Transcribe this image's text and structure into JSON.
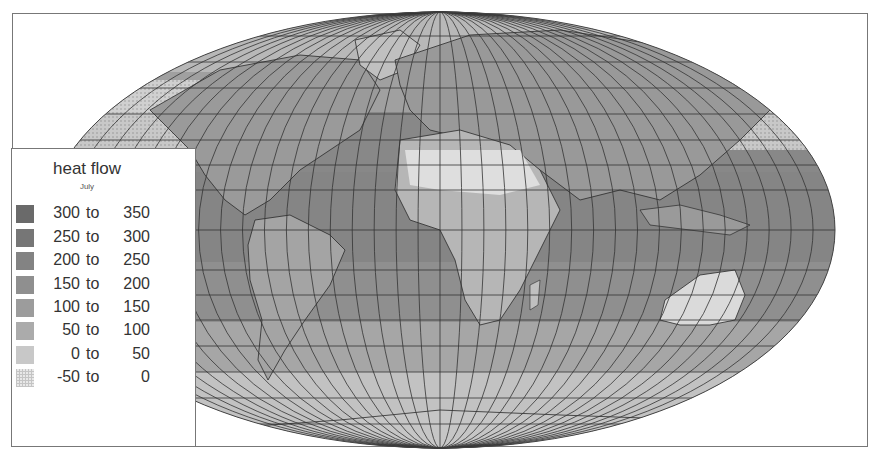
{
  "legend": {
    "title": "heat flow",
    "subtitle": "July",
    "classes": [
      {
        "lo": "300",
        "to": "to",
        "hi": "350",
        "color": "#6a6a6a",
        "pattern": "solid"
      },
      {
        "lo": "250",
        "to": "to",
        "hi": "300",
        "color": "#767676",
        "pattern": "solid"
      },
      {
        "lo": "200",
        "to": "to",
        "hi": "250",
        "color": "#838383",
        "pattern": "solid"
      },
      {
        "lo": "150",
        "to": "to",
        "hi": "200",
        "color": "#8f8f8f",
        "pattern": "solid"
      },
      {
        "lo": "100",
        "to": "to",
        "hi": "150",
        "color": "#9c9c9c",
        "pattern": "solid"
      },
      {
        "lo": "50",
        "to": "to",
        "hi": "100",
        "color": "#ababab",
        "pattern": "solid"
      },
      {
        "lo": "0",
        "to": "to",
        "hi": "50",
        "color": "#c8c8c8",
        "pattern": "solid"
      },
      {
        "lo": "-50",
        "to": "to",
        "hi": "0",
        "color": "#d6d6d6",
        "pattern": "dotted"
      }
    ]
  },
  "map": {
    "projection": "mollweide-like",
    "graticule_step_deg": 10,
    "ocean_color": "#8e8e8e",
    "land_light_color": "#d2d2d2",
    "graticule_color": "#333333",
    "border_color": "#2a2a2a"
  }
}
